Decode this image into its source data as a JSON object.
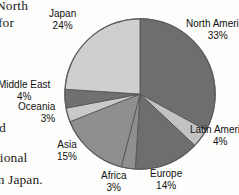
{
  "page": {
    "background_color": "#fdfdfb",
    "body_text_fragments": [
      {
        "name": "north",
        "text": "North"
      },
      {
        "name": "for",
        "text": "for"
      },
      {
        "name": "d",
        "text": "d"
      },
      {
        "name": "gional",
        "text": "gional"
      },
      {
        "name": "japan",
        "text": "m Japan."
      }
    ]
  },
  "chart_data": {
    "type": "pie",
    "title": "",
    "xlabel": "",
    "ylabel": "",
    "legend_position": "callout-labels",
    "grid": false,
    "start_angle_deg": 0,
    "direction": "clockwise",
    "total_percent": 100,
    "center": {
      "x": 140,
      "y": 94
    },
    "radius": 76,
    "categories": [
      "North America",
      "Latin America",
      "Europe",
      "Africa",
      "Asia",
      "Oceania",
      "Middle East",
      "Japan"
    ],
    "values": [
      33,
      4,
      14,
      3,
      15,
      3,
      4,
      24
    ],
    "slices": [
      {
        "label": "North America",
        "value": 33,
        "pct_text": "33%",
        "color": "#6e6e6e"
      },
      {
        "label": "Latin America",
        "value": 4,
        "pct_text": "4%",
        "color": "#c2c2c2"
      },
      {
        "label": "Europe",
        "value": 14,
        "pct_text": "14%",
        "color": "#6e6e6e"
      },
      {
        "label": "Africa",
        "value": 3,
        "pct_text": "3%",
        "color": "#8f8f8f"
      },
      {
        "label": "Asia",
        "value": 15,
        "pct_text": "15%",
        "color": "#8f8f8f"
      },
      {
        "label": "Oceania",
        "value": 3,
        "pct_text": "3%",
        "color": "#c9c9c9"
      },
      {
        "label": "Middle East",
        "value": 4,
        "pct_text": "4%",
        "color": "#707070"
      },
      {
        "label": "Japan",
        "value": 24,
        "pct_text": "24%",
        "color": "#cfcfcf"
      }
    ],
    "outline_color": "#555555"
  },
  "labels": {
    "north_america": {
      "name": "North America",
      "pct": "33%"
    },
    "latin_america": {
      "name": "Latin America",
      "pct": "4%"
    },
    "europe": {
      "name": "Europe",
      "pct": "14%"
    },
    "africa": {
      "name": "Africa",
      "pct": "3%"
    },
    "asia": {
      "name": "Asia",
      "pct": "15%"
    },
    "oceania": {
      "name": "Oceania",
      "pct": "3%"
    },
    "middle_east": {
      "name": "Middle East",
      "pct": "4%"
    },
    "japan": {
      "name": "Japan",
      "pct": "24%"
    }
  }
}
